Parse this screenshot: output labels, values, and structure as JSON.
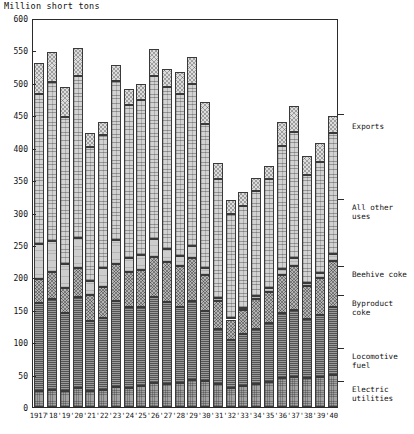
{
  "chart_data": {
    "type": "bar",
    "stacked": true,
    "title": "Million short tons",
    "xlabel": "",
    "ylabel": "Million short tons",
    "ylim": [
      0,
      600
    ],
    "ytick_step": 50,
    "yticks": [
      0,
      50,
      100,
      150,
      200,
      250,
      300,
      350,
      400,
      450,
      500,
      550,
      600
    ],
    "grid": false,
    "legend_position": "right",
    "categories": [
      "1917",
      "'18",
      "'19",
      "'20",
      "'21",
      "'22",
      "'23",
      "'24",
      "'25",
      "'26",
      "'27",
      "'28",
      "'29",
      "'30",
      "'31",
      "'32",
      "'33",
      "'34",
      "'35",
      "'36",
      "'37",
      "'38",
      "'39",
      "'40"
    ],
    "series": [
      {
        "name": "Electric utilities",
        "values": [
          24,
          27,
          24,
          30,
          25,
          27,
          31,
          30,
          33,
          37,
          36,
          37,
          41,
          40,
          35,
          30,
          32,
          35,
          38,
          44,
          46,
          44,
          47,
          50
        ]
      },
      {
        "name": "Locomotive fuel",
        "values": [
          136,
          139,
          121,
          139,
          108,
          111,
          133,
          124,
          122,
          133,
          126,
          118,
          123,
          108,
          86,
          73,
          80,
          86,
          91,
          101,
          104,
          92,
          95,
          104
        ]
      },
      {
        "name": "Byproduct coke",
        "values": [
          37,
          42,
          39,
          46,
          40,
          47,
          56,
          54,
          57,
          62,
          61,
          63,
          66,
          55,
          42,
          32,
          37,
          45,
          49,
          59,
          68,
          50,
          57,
          71
        ]
      },
      {
        "name": "Beehive coke",
        "values": [
          54,
          48,
          36,
          45,
          22,
          29,
          37,
          22,
          22,
          27,
          21,
          15,
          18,
          11,
          5,
          2,
          3,
          5,
          6,
          9,
          12,
          5,
          7,
          11
        ]
      },
      {
        "name": "All other uses",
        "values": [
          232,
          246,
          228,
          250,
          206,
          206,
          246,
          236,
          240,
          252,
          249,
          250,
          250,
          222,
          184,
          160,
          158,
          162,
          167,
          190,
          194,
          167,
          172,
          186
        ]
      },
      {
        "name": "Exports",
        "values": [
          48,
          46,
          45,
          44,
          21,
          20,
          25,
          25,
          25,
          41,
          29,
          34,
          42,
          34,
          24,
          22,
          21,
          20,
          20,
          36,
          40,
          29,
          29,
          27
        ]
      }
    ],
    "totals": [
      531,
      548,
      493,
      554,
      422,
      440,
      528,
      491,
      499,
      552,
      522,
      517,
      540,
      470,
      376,
      319,
      331,
      353,
      371,
      439,
      464,
      387,
      407,
      449
    ],
    "legend_labels": [
      "Exports",
      "All other uses",
      "Beehive coke",
      "Byproduct coke",
      "Locomotive fuel",
      "Electric utilities"
    ]
  },
  "legend_items": [
    {
      "label": "Exports",
      "y": 122,
      "tick_y": 114
    },
    {
      "label": "All other uses",
      "y": 203,
      "tick_y": 199
    },
    {
      "label": "Beehive coke",
      "y": 270,
      "tick_y": 266
    },
    {
      "label": "Byproduct coke",
      "y": 299,
      "tick_y": 295
    },
    {
      "label": "Locomotive fuel",
      "y": 352,
      "tick_y": 348
    },
    {
      "label": "Electric utilities",
      "y": 385,
      "tick_y": 381
    }
  ]
}
